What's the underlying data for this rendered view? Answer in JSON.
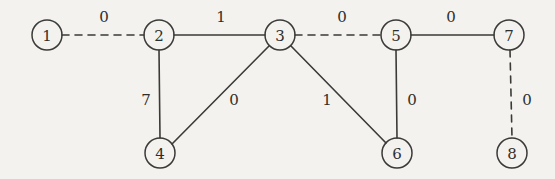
{
  "figure": {
    "type": "undirected-weighted-graph",
    "background_color": "#f4f2ee",
    "stroke_color": "#3a3a38",
    "text_color": "#2e2e2c"
  },
  "nodes": [
    {
      "id": "1",
      "label": "1",
      "cx": 47,
      "cy": 35,
      "r": 15
    },
    {
      "id": "2",
      "label": "2",
      "cx": 159,
      "cy": 35,
      "r": 15
    },
    {
      "id": "3",
      "label": "3",
      "cx": 280,
      "cy": 35,
      "r": 15
    },
    {
      "id": "4",
      "label": "4",
      "cx": 160,
      "cy": 153,
      "r": 15
    },
    {
      "id": "5",
      "label": "5",
      "cx": 396,
      "cy": 35,
      "r": 15
    },
    {
      "id": "6",
      "label": "6",
      "cx": 397,
      "cy": 153,
      "r": 15
    },
    {
      "id": "7",
      "label": "7",
      "cx": 509,
      "cy": 35,
      "r": 15
    },
    {
      "id": "8",
      "label": "8",
      "cx": 512,
      "cy": 153,
      "r": 15
    }
  ],
  "edges": [
    {
      "id": "e1-2",
      "source": "1",
      "target": "2",
      "weight": "0",
      "style": "dashed",
      "x1": 62,
      "y1": 35,
      "x2": 144,
      "y2": 35,
      "label_x": 104,
      "label_y": 17
    },
    {
      "id": "e2-3",
      "source": "2",
      "target": "3",
      "weight": "1",
      "style": "solid",
      "x1": 174,
      "y1": 35,
      "x2": 265,
      "y2": 35,
      "label_x": 221,
      "label_y": 17
    },
    {
      "id": "e3-5",
      "source": "3",
      "target": "5",
      "weight": "0",
      "style": "dashed",
      "x1": 295,
      "y1": 35,
      "x2": 381,
      "y2": 35,
      "label_x": 342,
      "label_y": 17
    },
    {
      "id": "e5-7",
      "source": "5",
      "target": "7",
      "weight": "0",
      "style": "solid",
      "x1": 411,
      "y1": 35,
      "x2": 494,
      "y2": 35,
      "label_x": 451,
      "label_y": 17
    },
    {
      "id": "e2-4",
      "source": "2",
      "target": "4",
      "weight": "7",
      "style": "solid",
      "x1": 159,
      "y1": 50,
      "x2": 160,
      "y2": 138,
      "label_x": 146,
      "label_y": 100
    },
    {
      "id": "e3-4",
      "source": "3",
      "target": "4",
      "weight": "0",
      "style": "solid",
      "x1": 269,
      "y1": 46,
      "x2": 172,
      "y2": 144,
      "label_x": 234,
      "label_y": 100
    },
    {
      "id": "e3-6",
      "source": "3",
      "target": "6",
      "weight": "1",
      "style": "solid",
      "x1": 291,
      "y1": 46,
      "x2": 386,
      "y2": 143,
      "label_x": 327,
      "label_y": 100
    },
    {
      "id": "e5-6",
      "source": "5",
      "target": "6",
      "weight": "0",
      "style": "solid",
      "x1": 396,
      "y1": 50,
      "x2": 397,
      "y2": 138,
      "label_x": 412,
      "label_y": 100
    },
    {
      "id": "e7-8",
      "source": "7",
      "target": "8",
      "weight": "0",
      "style": "dashed",
      "x1": 510,
      "y1": 50,
      "x2": 512,
      "y2": 138,
      "label_x": 527,
      "label_y": 100
    }
  ]
}
